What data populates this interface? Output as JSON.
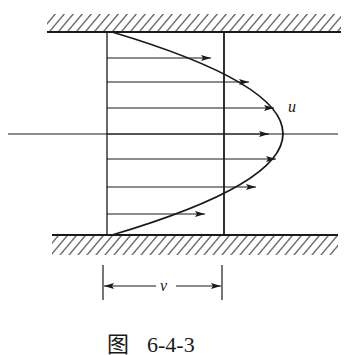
{
  "figure": {
    "caption_prefix": "图",
    "caption_number": "6-4-3",
    "labels": {
      "velocity_profile": "u",
      "width_dimension": "v"
    },
    "colors": {
      "ink": "#1a1a1a",
      "background": "#ffffff"
    },
    "geometry": {
      "top_wall_y": 32,
      "bottom_wall_y": 235,
      "centerline_y": 134,
      "left_section_x": 107,
      "right_section_x": 224,
      "profile_apex_x": 283,
      "arrow_rows_y": [
        58,
        82,
        108,
        134,
        159,
        187,
        214
      ]
    }
  }
}
